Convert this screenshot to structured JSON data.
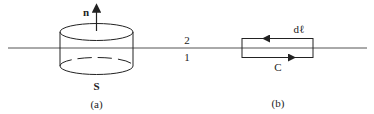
{
  "figure": {
    "colors": {
      "stroke": "#222222",
      "interface": "#444444",
      "background": "#ffffff"
    },
    "interface_labels": {
      "upper": "2",
      "lower": "1"
    },
    "panel_a": {
      "caption": "(a)",
      "normal_label": "n",
      "surface_label": "S"
    },
    "panel_b": {
      "caption": "(b)",
      "element_label": "dℓ",
      "contour_label": "C"
    }
  }
}
